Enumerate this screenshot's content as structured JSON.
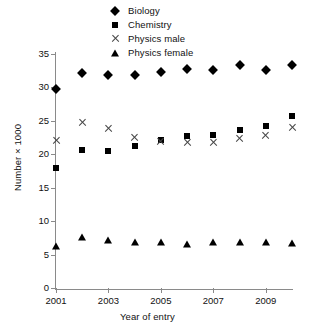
{
  "chart_data": {
    "type": "scatter",
    "title": "",
    "xlabel": "Year of entry",
    "ylabel": "Number × 1000",
    "x": [
      2001,
      2002,
      2003,
      2004,
      2005,
      2006,
      2007,
      2008,
      2009,
      2010
    ],
    "xlim": [
      2001,
      2010
    ],
    "ylim": [
      0,
      35
    ],
    "ytick_labels": [
      "0",
      "5",
      "10",
      "15",
      "20",
      "25",
      "30",
      "35"
    ],
    "ytick_values": [
      0,
      5,
      10,
      15,
      20,
      25,
      30,
      35
    ],
    "xtick_labels": [
      "2001",
      "2003",
      "2005",
      "2007",
      "2009"
    ],
    "xtick_values": [
      2001,
      2003,
      2005,
      2007,
      2009
    ],
    "grid": false,
    "legend_position": "top-center",
    "series": [
      {
        "name": "Biology",
        "marker": "diamond",
        "color": "#000000",
        "values": [
          29.7,
          32.2,
          31.9,
          31.9,
          32.3,
          32.7,
          32.6,
          33.3,
          32.6,
          33.3
        ]
      },
      {
        "name": "Chemistry",
        "marker": "square",
        "color": "#000000",
        "values": [
          18.0,
          20.7,
          20.5,
          21.2,
          22.2,
          22.8,
          22.9,
          23.6,
          24.2,
          25.7
        ]
      },
      {
        "name": "Physics male",
        "marker": "cross",
        "color": "#444444",
        "values": [
          22.0,
          24.7,
          23.9,
          22.5,
          21.9,
          21.8,
          21.8,
          22.3,
          22.8,
          24.0
        ]
      },
      {
        "name": "Physics female",
        "marker": "triangle",
        "color": "#000000",
        "values": [
          6.3,
          7.7,
          7.2,
          6.9,
          6.9,
          6.6,
          6.9,
          6.9,
          6.9,
          6.8
        ]
      }
    ]
  },
  "legend": {
    "items": [
      {
        "label": "Biology",
        "marker": "diamond"
      },
      {
        "label": "Chemistry",
        "marker": "square"
      },
      {
        "label": "Physics male",
        "marker": "cross"
      },
      {
        "label": "Physics female",
        "marker": "triangle"
      }
    ]
  }
}
